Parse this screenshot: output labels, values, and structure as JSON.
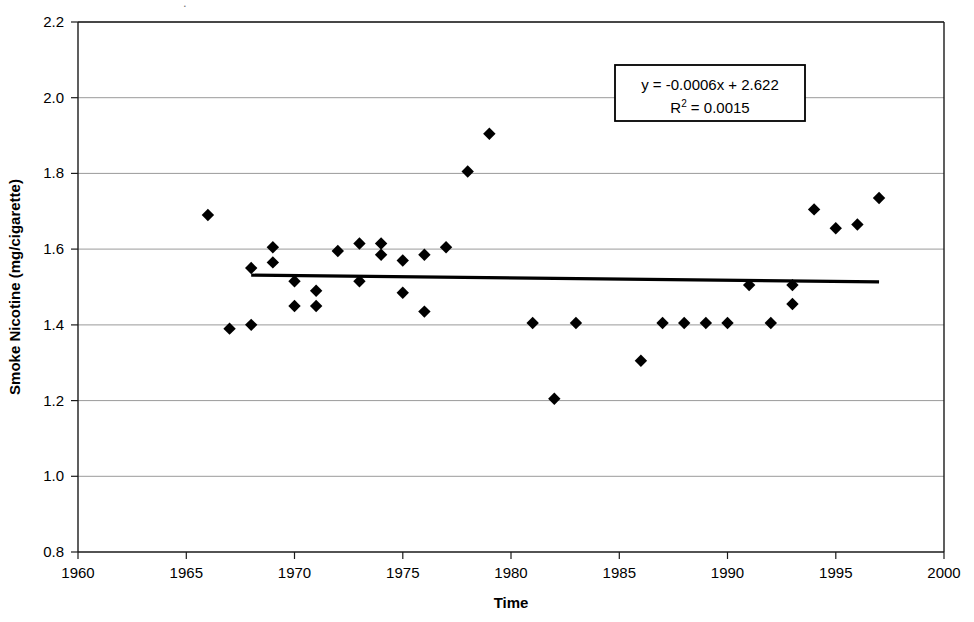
{
  "chart_data": {
    "type": "scatter",
    "title": "",
    "xlabel": "Time",
    "ylabel": "Smoke Nicotine (mg/cigarette)",
    "xlim": [
      1960,
      2000
    ],
    "ylim": [
      0.8,
      2.2
    ],
    "xticks": [
      1960,
      1965,
      1970,
      1975,
      1980,
      1985,
      1990,
      1995,
      2000
    ],
    "yticks": [
      0.8,
      1.0,
      1.2,
      1.4,
      1.6,
      1.8,
      2.0,
      2.2
    ],
    "xtick_labels": [
      "1960",
      "1965",
      "1970",
      "1975",
      "1980",
      "1985",
      "1990",
      "1995",
      "2000"
    ],
    "ytick_labels": [
      "0.8",
      "1.0",
      "1.2",
      "1.4",
      "1.6",
      "1.8",
      "2.0",
      "2.2"
    ],
    "grid": true,
    "grid_axis": "y",
    "legend": false,
    "marker": "diamond",
    "marker_color": "#000000",
    "series": [
      {
        "name": "Smoke Nicotine",
        "points": [
          {
            "x": 1966,
            "y": 1.69
          },
          {
            "x": 1967,
            "y": 1.39
          },
          {
            "x": 1968,
            "y": 1.55
          },
          {
            "x": 1968,
            "y": 1.4
          },
          {
            "x": 1969,
            "y": 1.605
          },
          {
            "x": 1969,
            "y": 1.565
          },
          {
            "x": 1970,
            "y": 1.515
          },
          {
            "x": 1970,
            "y": 1.45
          },
          {
            "x": 1971,
            "y": 1.49
          },
          {
            "x": 1971,
            "y": 1.45
          },
          {
            "x": 1972,
            "y": 1.595
          },
          {
            "x": 1973,
            "y": 1.615
          },
          {
            "x": 1973,
            "y": 1.515
          },
          {
            "x": 1974,
            "y": 1.615
          },
          {
            "x": 1974,
            "y": 1.585
          },
          {
            "x": 1975,
            "y": 1.57
          },
          {
            "x": 1975,
            "y": 1.485
          },
          {
            "x": 1976,
            "y": 1.585
          },
          {
            "x": 1976,
            "y": 1.435
          },
          {
            "x": 1977,
            "y": 1.605
          },
          {
            "x": 1978,
            "y": 1.805
          },
          {
            "x": 1979,
            "y": 1.905
          },
          {
            "x": 1981,
            "y": 1.405
          },
          {
            "x": 1982,
            "y": 1.205
          },
          {
            "x": 1983,
            "y": 1.405
          },
          {
            "x": 1986,
            "y": 1.305
          },
          {
            "x": 1987,
            "y": 1.405
          },
          {
            "x": 1988,
            "y": 1.405
          },
          {
            "x": 1989,
            "y": 1.405
          },
          {
            "x": 1990,
            "y": 1.405
          },
          {
            "x": 1991,
            "y": 1.505
          },
          {
            "x": 1992,
            "y": 1.405
          },
          {
            "x": 1993,
            "y": 1.505
          },
          {
            "x": 1993,
            "y": 1.455
          },
          {
            "x": 1994,
            "y": 1.705
          },
          {
            "x": 1995,
            "y": 1.655
          },
          {
            "x": 1996,
            "y": 1.665
          },
          {
            "x": 1997,
            "y": 1.735
          }
        ]
      }
    ],
    "trendline": {
      "equation": "y = -0.0006x + 2.622",
      "r_squared_label": "R",
      "r_squared_exponent": "2",
      "r_squared_value": "= 0.0015",
      "slope": -0.0006,
      "intercept": 2.622,
      "r_squared": 0.0015,
      "x_start": 1968,
      "x_end": 1997,
      "y_start": 1.5312,
      "y_end": 1.5138
    },
    "annotation_box": {
      "line1": "y = -0.0006x + 2.622",
      "line2_prefix": "R",
      "line2_sup": "2",
      "line2_suffix": " = 0.0015"
    }
  }
}
